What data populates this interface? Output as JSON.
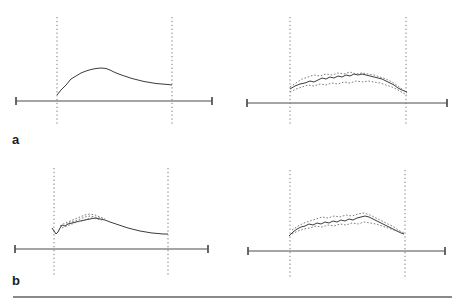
{
  "figure": {
    "labels": {
      "a": "a",
      "b": "b"
    }
  },
  "colors": {
    "background": "#ffffff",
    "axis": "#4d4d4d",
    "boundary_dotted": "#7a7a7a",
    "curve_solid": "#3b3b3b",
    "curve_dotted": "#6f6f6f",
    "rule": "#8a8a8a",
    "label": "#1c1c1c"
  },
  "chart_data": [
    {
      "id": "a_left",
      "type": "line",
      "row_label": "a",
      "title": "",
      "xlabel": "",
      "ylabel": "",
      "grid": false,
      "legend": false,
      "axis": {
        "x1": 16,
        "x2": 212,
        "y": 101,
        "tick_half": 4
      },
      "window_lines": {
        "x_left": 57,
        "x_right": 172,
        "y_top": 17,
        "y_bottom": 125
      },
      "series": [
        {
          "name": "trace-1",
          "style": "solid",
          "points": [
            [
              57,
              95
            ],
            [
              61,
              90
            ],
            [
              66,
              85
            ],
            [
              71,
              79
            ],
            [
              76,
              76
            ],
            [
              81,
              73
            ],
            [
              86,
              71
            ],
            [
              91,
              69.5
            ],
            [
              96,
              68.5
            ],
            [
              101,
              68
            ],
            [
              106,
              68.5
            ],
            [
              110,
              70
            ],
            [
              115,
              72.5
            ],
            [
              120,
              74.5
            ],
            [
              126,
              76.5
            ],
            [
              132,
              78.5
            ],
            [
              138,
              80
            ],
            [
              144,
              81.5
            ],
            [
              150,
              82.5
            ],
            [
              156,
              83.5
            ],
            [
              162,
              84
            ],
            [
              168,
              84.5
            ],
            [
              172,
              85
            ]
          ]
        }
      ]
    },
    {
      "id": "a_right",
      "type": "line",
      "row_label": "a",
      "title": "",
      "xlabel": "",
      "ylabel": "",
      "grid": false,
      "legend": false,
      "axis": {
        "x1": 247,
        "x2": 447,
        "y": 103,
        "tick_half": 4
      },
      "window_lines": {
        "x_left": 290,
        "x_right": 406,
        "y_top": 17,
        "y_bottom": 125
      },
      "series": [
        {
          "name": "trace-1",
          "style": "solid",
          "points": [
            [
              290,
              89
            ],
            [
              295,
              86
            ],
            [
              300,
              84
            ],
            [
              305,
              83
            ],
            [
              310,
              81
            ],
            [
              314,
              82
            ],
            [
              318,
              80
            ],
            [
              322,
              78
            ],
            [
              326,
              79
            ],
            [
              330,
              77
            ],
            [
              334,
              78
            ],
            [
              338,
              76
            ],
            [
              342,
              77
            ],
            [
              346,
              75
            ],
            [
              350,
              76
            ],
            [
              354,
              74
            ],
            [
              358,
              75
            ],
            [
              362,
              74
            ],
            [
              366,
              75
            ],
            [
              370,
              76
            ],
            [
              374,
              77
            ],
            [
              378,
              78
            ],
            [
              382,
              79
            ],
            [
              386,
              81
            ],
            [
              390,
              83
            ],
            [
              394,
              85
            ],
            [
              398,
              88
            ],
            [
              402,
              90
            ],
            [
              407,
              92
            ]
          ]
        },
        {
          "name": "trace-2",
          "style": "dotted",
          "points": [
            [
              290,
              87
            ],
            [
              296,
              83
            ],
            [
              302,
              79
            ],
            [
              308,
              77
            ],
            [
              314,
              75
            ],
            [
              320,
              76
            ],
            [
              326,
              74
            ],
            [
              332,
              75
            ],
            [
              338,
              73
            ],
            [
              344,
              74
            ],
            [
              350,
              72
            ],
            [
              356,
              74
            ],
            [
              362,
              73
            ],
            [
              368,
              74
            ],
            [
              374,
              75
            ],
            [
              380,
              77
            ],
            [
              386,
              79
            ],
            [
              392,
              82
            ],
            [
              398,
              86
            ],
            [
              403,
              90
            ],
            [
              407,
              93
            ]
          ]
        },
        {
          "name": "trace-3",
          "style": "dotted",
          "points": [
            [
              290,
              92
            ],
            [
              296,
              89
            ],
            [
              302,
              87
            ],
            [
              308,
              85
            ],
            [
              314,
              86
            ],
            [
              320,
              84
            ],
            [
              326,
              85
            ],
            [
              332,
              83
            ],
            [
              338,
              84
            ],
            [
              344,
              82
            ],
            [
              350,
              83
            ],
            [
              356,
              81
            ],
            [
              362,
              82
            ],
            [
              368,
              81
            ],
            [
              374,
              82
            ],
            [
              380,
              83
            ],
            [
              386,
              85
            ],
            [
              392,
              87
            ],
            [
              398,
              90
            ],
            [
              403,
              93
            ],
            [
              407,
              95
            ]
          ]
        }
      ]
    },
    {
      "id": "b_left",
      "type": "line",
      "row_label": "b",
      "title": "",
      "xlabel": "",
      "ylabel": "",
      "grid": false,
      "legend": false,
      "axis": {
        "x1": 15,
        "x2": 208,
        "y": 249,
        "tick_half": 4
      },
      "window_lines": {
        "x_left": 54,
        "x_right": 168,
        "y_top": 168,
        "y_bottom": 276
      },
      "series": [
        {
          "name": "trace-1",
          "style": "solid",
          "points": [
            [
              52,
              228
            ],
            [
              54,
              231
            ],
            [
              56,
              234
            ],
            [
              58,
              232
            ],
            [
              60,
              228
            ],
            [
              62,
              225
            ],
            [
              65,
              226
            ],
            [
              68,
              224
            ],
            [
              72,
              223
            ],
            [
              76,
              222
            ],
            [
              80,
              221
            ],
            [
              85,
              220
            ],
            [
              90,
              219
            ],
            [
              95,
              218
            ],
            [
              100,
              219
            ],
            [
              105,
              220
            ],
            [
              110,
              222
            ],
            [
              116,
              224
            ],
            [
              122,
              226
            ],
            [
              128,
              228
            ],
            [
              134,
              229.5
            ],
            [
              140,
              231
            ],
            [
              146,
              232
            ],
            [
              152,
              233
            ],
            [
              158,
              233.5
            ],
            [
              163,
              234
            ],
            [
              168,
              234
            ]
          ]
        },
        {
          "name": "trace-2",
          "style": "dotted",
          "points": [
            [
              60,
              226
            ],
            [
              65,
              223
            ],
            [
              70,
              221
            ],
            [
              75,
              219
            ],
            [
              80,
              217
            ],
            [
              85,
              215
            ],
            [
              90,
              214
            ],
            [
              95,
              215
            ],
            [
              100,
              217
            ],
            [
              105,
              219
            ]
          ]
        },
        {
          "name": "trace-3",
          "style": "dotted",
          "points": [
            [
              60,
              227
            ],
            [
              65,
              225
            ],
            [
              70,
              222
            ],
            [
              75,
              221
            ],
            [
              80,
              219
            ],
            [
              85,
              217
            ],
            [
              90,
              216
            ],
            [
              95,
              217
            ],
            [
              100,
              218
            ],
            [
              105,
              220
            ]
          ]
        },
        {
          "name": "trace-4",
          "style": "dotted",
          "points": [
            [
              62,
              228
            ],
            [
              67,
              226
            ],
            [
              72,
              224
            ],
            [
              77,
              222
            ],
            [
              82,
              221
            ],
            [
              87,
              219
            ],
            [
              92,
              218
            ],
            [
              97,
              219
            ],
            [
              102,
              220
            ]
          ]
        }
      ]
    },
    {
      "id": "b_right",
      "type": "line",
      "row_label": "b",
      "title": "",
      "xlabel": "",
      "ylabel": "",
      "grid": false,
      "legend": false,
      "axis": {
        "x1": 248,
        "x2": 445,
        "y": 251,
        "tick_half": 4
      },
      "window_lines": {
        "x_left": 290,
        "x_right": 405,
        "y_top": 170,
        "y_bottom": 278
      },
      "series": [
        {
          "name": "trace-1",
          "style": "solid",
          "points": [
            [
              289,
              236
            ],
            [
              293,
              232
            ],
            [
              297,
              229
            ],
            [
              301,
              227
            ],
            [
              305,
              226
            ],
            [
              309,
              224
            ],
            [
              313,
              225
            ],
            [
              317,
              223
            ],
            [
              321,
              224
            ],
            [
              325,
              222
            ],
            [
              329,
              223
            ],
            [
              333,
              221
            ],
            [
              337,
              222
            ],
            [
              341,
              220
            ],
            [
              345,
              221
            ],
            [
              349,
              219
            ],
            [
              353,
              220
            ],
            [
              357,
              218
            ],
            [
              361,
              217
            ],
            [
              365,
              216
            ],
            [
              369,
              217
            ],
            [
              373,
              219
            ],
            [
              377,
              221
            ],
            [
              381,
              223
            ],
            [
              385,
              225
            ],
            [
              389,
              227
            ],
            [
              393,
              229
            ],
            [
              397,
              231
            ],
            [
              401,
              233
            ],
            [
              404,
              234
            ]
          ]
        },
        {
          "name": "trace-2",
          "style": "dotted",
          "points": [
            [
              292,
              230
            ],
            [
              298,
              226
            ],
            [
              304,
              223
            ],
            [
              310,
              221
            ],
            [
              316,
              219
            ],
            [
              322,
              217
            ],
            [
              328,
              218
            ],
            [
              334,
              216
            ],
            [
              340,
              217
            ],
            [
              346,
              215
            ],
            [
              352,
              216
            ],
            [
              358,
              214
            ],
            [
              364,
              213
            ],
            [
              370,
              215
            ],
            [
              376,
              218
            ],
            [
              382,
              221
            ],
            [
              388,
              224
            ],
            [
              394,
              227
            ],
            [
              400,
              231
            ],
            [
              404,
              233
            ]
          ]
        },
        {
          "name": "trace-3",
          "style": "dotted",
          "points": [
            [
              292,
              234
            ],
            [
              298,
              231
            ],
            [
              304,
              229
            ],
            [
              310,
              228
            ],
            [
              316,
              226
            ],
            [
              322,
              227
            ],
            [
              328,
              225
            ],
            [
              334,
              226
            ],
            [
              340,
              224
            ],
            [
              346,
              225
            ],
            [
              352,
              223
            ],
            [
              358,
              224
            ],
            [
              364,
              222
            ],
            [
              370,
              223
            ],
            [
              376,
              224
            ],
            [
              382,
              226
            ],
            [
              388,
              228
            ],
            [
              394,
              230
            ],
            [
              400,
              232
            ],
            [
              404,
              234
            ]
          ]
        }
      ]
    }
  ]
}
